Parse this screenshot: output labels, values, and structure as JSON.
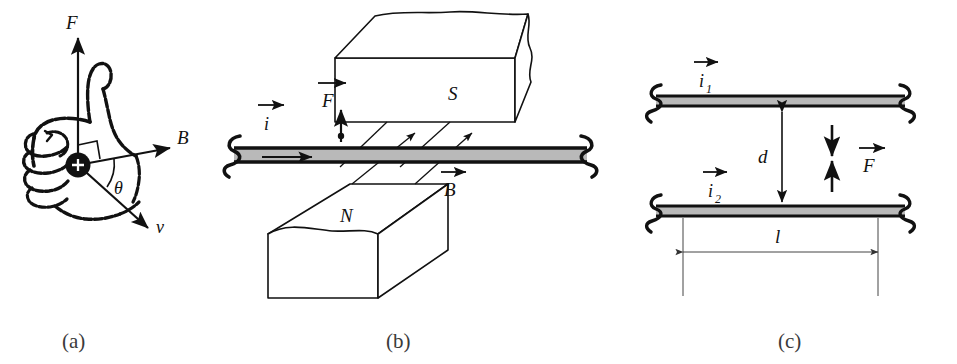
{
  "figure": {
    "caption_a": "(a)",
    "caption_b": "(b)",
    "caption_c": "(c)"
  },
  "panel_a": {
    "title": "right-hand-rule-for-magnetic-force-on-moving-charge",
    "label_force": "F",
    "label_field": "B",
    "label_velocity": "v",
    "label_angle": "θ",
    "charge_sign": "+",
    "vectors": [
      {
        "name": "force",
        "label": "F",
        "direction": "up"
      },
      {
        "name": "magnetic-field",
        "label": "B",
        "direction": "right"
      },
      {
        "name": "velocity",
        "label": "v",
        "direction": "down-right"
      }
    ]
  },
  "panel_b": {
    "title": "current-carrying-wire-between-magnet-poles",
    "label_current": "i",
    "label_force": "F",
    "label_field": "B",
    "label_pole_top": "S",
    "label_pole_bottom": "N",
    "vectors": [
      {
        "name": "current",
        "label": "i",
        "direction": "right"
      },
      {
        "name": "force",
        "label": "F",
        "direction": "up"
      },
      {
        "name": "magnetic-field",
        "label": "B",
        "direction": "right"
      }
    ]
  },
  "panel_c": {
    "title": "two-parallel-current-carrying-wires",
    "label_current_1": "i",
    "label_current_1_sub": "1",
    "label_current_2": "i",
    "label_current_2_sub": "2",
    "label_separation": "d",
    "label_length": "l",
    "label_force": "F",
    "vectors": [
      {
        "name": "current-1",
        "label": "i1",
        "direction": "right"
      },
      {
        "name": "current-2",
        "label": "i2",
        "direction": "right"
      },
      {
        "name": "force",
        "label": "F",
        "direction": "attractive"
      }
    ]
  },
  "colors": {
    "ink": "#111111",
    "wire_fill": "#b9b9b9",
    "paper": "#ffffff",
    "thin_line": "#444444"
  }
}
